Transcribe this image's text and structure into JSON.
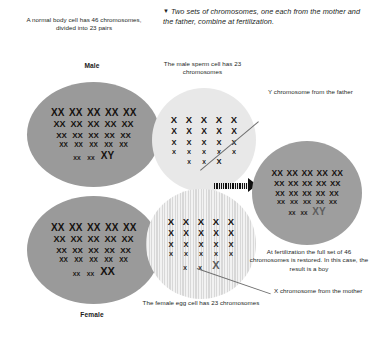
{
  "header": {
    "marker": "▼",
    "text": "Two sets of chromosomes, one each from the mother and the father, combine at fertilization."
  },
  "captions": {
    "body_cell": "A normal body cell has 46 chromosomes, divided into 23 pairs",
    "sperm_cell": "The male sperm cell has 23 chromosomes",
    "egg_cell": "The female egg cell has 23 chromosomes",
    "fertilization": "At fertilization the full set of 46 chromosomes is restored. In this case, the result is a boy",
    "y_from_father": "Y chromosome from the father",
    "x_from_mother": "X chromosome from the mother"
  },
  "labels": {
    "male": "Male",
    "female": "Female"
  },
  "cells": [
    {
      "id": "male-body-cell",
      "sex": "Male",
      "ploidy": "diploid",
      "chromosome_count": 46,
      "sex_chromosomes": "XY",
      "fill": "#9a9a9a",
      "style": "solid"
    },
    {
      "id": "female-body-cell",
      "sex": "Female",
      "ploidy": "diploid",
      "chromosome_count": 46,
      "sex_chromosomes": "XX",
      "fill": "#9a9a9a",
      "style": "solid"
    },
    {
      "id": "sperm-cell",
      "sex": "Male",
      "ploidy": "haploid",
      "chromosome_count": 23,
      "sex_chromosomes": "Y",
      "fill": "#e8e8e8",
      "style": "pale"
    },
    {
      "id": "egg-cell",
      "sex": "Female",
      "ploidy": "haploid",
      "chromosome_count": 23,
      "sex_chromosomes": "X",
      "fill": "#eeeeee",
      "style": "striped"
    },
    {
      "id": "fertilized-cell",
      "sex": "Boy",
      "ploidy": "diploid",
      "chromosome_count": 46,
      "sex_chromosomes": "XY",
      "fill": "#9e9e9e",
      "style": "solid"
    }
  ],
  "colors": {
    "ink": "#241f1d",
    "cell_dark": "#9a9a9a",
    "cell_pale": "#e8e8e8",
    "cell_striped_light": "#f2f2f2",
    "cell_striped_dark": "#d8d8d8",
    "arrow": "#111111",
    "leader": "#6e6e6e"
  }
}
